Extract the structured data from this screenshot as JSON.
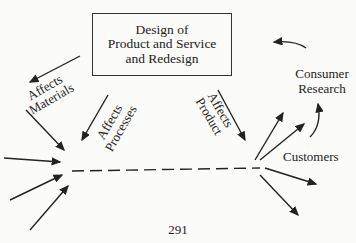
{
  "diagram": {
    "box": {
      "lines": [
        "Design of",
        "Product and Service",
        "and Redesign"
      ]
    },
    "labels": {
      "affects_materials": [
        "Affects",
        "Materials"
      ],
      "affects_processes": [
        "Affects",
        "Processes"
      ],
      "affects_product": [
        "Affects",
        "Product"
      ],
      "consumer_research": [
        "Consumer",
        "Research"
      ],
      "customers": "Customers"
    },
    "page_number": "291"
  }
}
